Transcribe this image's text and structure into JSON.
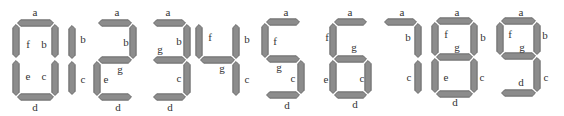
{
  "segment_color": "#8c8c8c",
  "digits": [
    {
      "digit": "0",
      "segments": [
        "a",
        "b",
        "c",
        "d",
        "e",
        "f"
      ],
      "labels": [
        "a",
        "f",
        "b",
        "e",
        "c",
        "d"
      ]
    },
    {
      "digit": "1",
      "segments": [
        "b",
        "c"
      ],
      "labels": [
        "b",
        "c"
      ]
    },
    {
      "digit": "2",
      "segments": [
        "a",
        "b",
        "g",
        "e",
        "d"
      ],
      "labels": [
        "a",
        "b",
        "g",
        "e",
        "d"
      ]
    },
    {
      "digit": "3",
      "segments": [
        "a",
        "b",
        "g",
        "c",
        "d"
      ],
      "labels": [
        "a",
        "g",
        "b",
        "c",
        "d"
      ]
    },
    {
      "digit": "4",
      "segments": [
        "f",
        "g",
        "b",
        "c"
      ],
      "labels": [
        "f",
        "b",
        "g",
        "c"
      ]
    },
    {
      "digit": "5",
      "segments": [
        "a",
        "f",
        "g",
        "c",
        "d"
      ],
      "labels": [
        "a",
        "f",
        "g",
        "c",
        "d"
      ]
    },
    {
      "digit": "6",
      "segments": [
        "a",
        "f",
        "g",
        "e",
        "c",
        "d"
      ],
      "labels": [
        "a",
        "f",
        "g",
        "e",
        "c",
        "d"
      ]
    },
    {
      "digit": "7",
      "segments": [
        "a",
        "b",
        "c"
      ],
      "labels": [
        "a",
        "b",
        "c"
      ]
    },
    {
      "digit": "8",
      "segments": [
        "a",
        "b",
        "c",
        "d",
        "e",
        "f",
        "g"
      ],
      "labels": [
        "a",
        "f",
        "b",
        "g",
        "e",
        "c",
        "d"
      ]
    },
    {
      "digit": "9",
      "segments": [
        "a",
        "b",
        "c",
        "d",
        "f",
        "g"
      ],
      "labels": [
        "a",
        "f",
        "b",
        "g",
        "d",
        "c"
      ]
    }
  ]
}
